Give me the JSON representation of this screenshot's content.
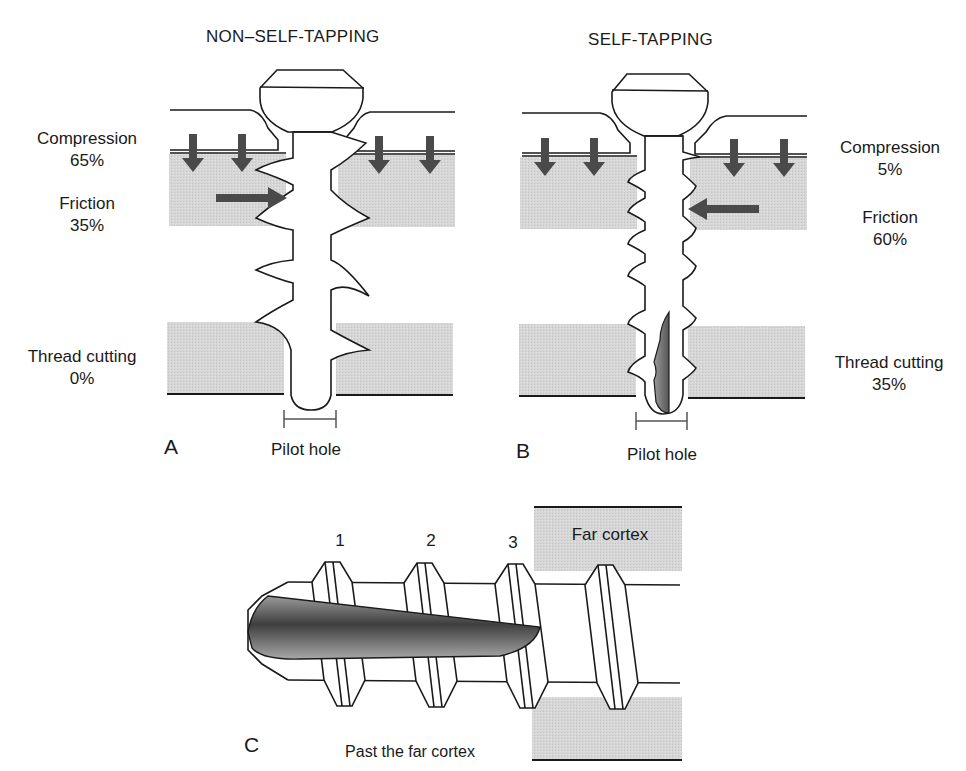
{
  "panel_a": {
    "title": "NON–SELF-TAPPING",
    "letter": "A",
    "compression": {
      "label": "Compression",
      "value": "65%"
    },
    "friction": {
      "label": "Friction",
      "value": "35%"
    },
    "thread_cutting": {
      "label": "Thread cutting",
      "value": "0%"
    },
    "pilot_hole": "Pilot hole"
  },
  "panel_b": {
    "title": "SELF-TAPPING",
    "letter": "B",
    "compression": {
      "label": "Compression",
      "value": "5%"
    },
    "friction": {
      "label": "Friction",
      "value": "60%"
    },
    "thread_cutting": {
      "label": "Thread cutting",
      "value": "35%"
    },
    "pilot_hole": "Pilot hole"
  },
  "panel_c": {
    "letter": "C",
    "thread_numbers": [
      "1",
      "2",
      "3"
    ],
    "far_cortex": "Far cortex",
    "caption": "Past the far cortex"
  },
  "colors": {
    "bone": "#d9d9d9",
    "arrow": "#4a4a4a",
    "line": "#1a1a1a",
    "flute": "#6e6e6e"
  }
}
